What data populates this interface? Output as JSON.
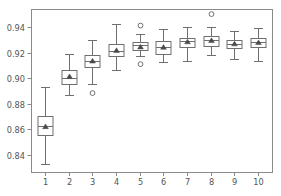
{
  "chart_data": {
    "type": "box",
    "title": "",
    "xlabel": "",
    "ylabel": "",
    "categories": [
      "1",
      "2",
      "3",
      "4",
      "5",
      "6",
      "7",
      "8",
      "9",
      "10"
    ],
    "xlim": [
      0.4,
      10.6
    ],
    "ylim": [
      0.8265,
      0.9545
    ],
    "grid": false,
    "legend": null,
    "ytick_labels": [
      "0.84",
      "0.86",
      "0.88",
      "0.90",
      "0.92",
      "0.94"
    ],
    "ytick_values": [
      0.84,
      0.86,
      0.88,
      0.9,
      0.92,
      0.94
    ],
    "xtick_labels": [
      "1",
      "2",
      "3",
      "4",
      "5",
      "6",
      "7",
      "8",
      "9",
      "10"
    ],
    "xtick_values": [
      1,
      2,
      3,
      4,
      5,
      6,
      7,
      8,
      9,
      10
    ],
    "show_means": true,
    "mean_marker": "triangle",
    "boxes": [
      {
        "category": "1",
        "whisker_low": 0.833,
        "q1": 0.8555,
        "median": 0.8625,
        "q3": 0.8705,
        "whisker_high": 0.893,
        "mean": 0.8622,
        "outliers": []
      },
      {
        "category": "2",
        "whisker_low": 0.887,
        "q1": 0.8955,
        "median": 0.9,
        "q3": 0.9065,
        "whisker_high": 0.9195,
        "mean": 0.9015,
        "outliers": []
      },
      {
        "category": "3",
        "whisker_low": 0.8955,
        "q1": 0.909,
        "median": 0.914,
        "q3": 0.918,
        "whisker_high": 0.93,
        "mean": 0.9137,
        "outliers": [
          0.8885
        ]
      },
      {
        "category": "4",
        "whisker_low": 0.9065,
        "q1": 0.9175,
        "median": 0.9215,
        "q3": 0.927,
        "whisker_high": 0.943,
        "mean": 0.922,
        "outliers": []
      },
      {
        "category": "5",
        "whisker_low": 0.9175,
        "q1": 0.922,
        "median": 0.926,
        "q3": 0.9285,
        "whisker_high": 0.9345,
        "mean": 0.9248,
        "outliers": [
          0.9415,
          0.9112
        ]
      },
      {
        "category": "6",
        "whisker_low": 0.9125,
        "q1": 0.9195,
        "median": 0.925,
        "q3": 0.929,
        "whisker_high": 0.939,
        "mean": 0.9245,
        "outliers": []
      },
      {
        "category": "7",
        "whisker_low": 0.914,
        "q1": 0.9245,
        "median": 0.929,
        "q3": 0.932,
        "whisker_high": 0.9405,
        "mean": 0.9288,
        "outliers": []
      },
      {
        "category": "8",
        "whisker_low": 0.918,
        "q1": 0.9255,
        "median": 0.93,
        "q3": 0.9335,
        "whisker_high": 0.94,
        "mean": 0.9298,
        "outliers": [
          0.9505
        ]
      },
      {
        "category": "9",
        "whisker_low": 0.9155,
        "q1": 0.924,
        "median": 0.927,
        "q3": 0.93,
        "whisker_high": 0.937,
        "mean": 0.9272,
        "outliers": []
      },
      {
        "category": "10",
        "whisker_low": 0.9135,
        "q1": 0.9245,
        "median": 0.9285,
        "q3": 0.9315,
        "whisker_high": 0.9395,
        "mean": 0.9282,
        "outliers": []
      }
    ],
    "colors": {
      "box_edge": "#6f6f6f",
      "whisker": "#6f6f6f",
      "median": "#6f6f6f",
      "flier_edge": "#6f6f6f",
      "mean_marker": "#4a4a4a",
      "spine": "#8a8a8a",
      "tick_label": "#545454",
      "background": "#ffffff"
    },
    "geometry": {
      "plot_left": 31,
      "plot_right": 272,
      "plot_top": 9,
      "plot_bottom": 172,
      "box_width_px": 15,
      "cap_width_px": 9,
      "flier_radius_px": 2.4,
      "mean_size_px": 3.6
    }
  }
}
